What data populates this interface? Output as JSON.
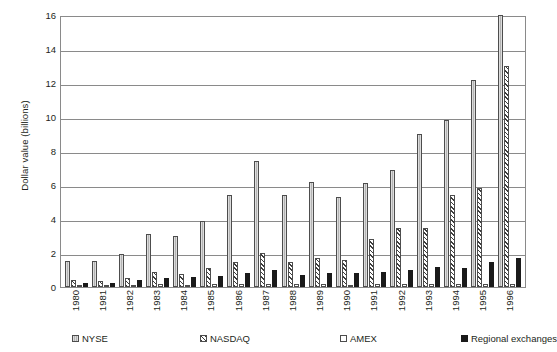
{
  "chart_data": {
    "type": "bar",
    "title": "",
    "xlabel": "",
    "ylabel": "Dollar value (billions)",
    "ylim": [
      0,
      16
    ],
    "yticks": [
      0,
      2,
      4,
      6,
      8,
      10,
      12,
      14,
      16
    ],
    "grid": true,
    "legend_position": "bottom",
    "categories": [
      "1980",
      "1981",
      "1982",
      "1983",
      "1984",
      "1985",
      "1986",
      "1987",
      "1988",
      "1989",
      "1990",
      "1991",
      "1992",
      "1993",
      "1994",
      "1995",
      "1996"
    ],
    "series": [
      {
        "name": "NYSE",
        "color": "#b3b3b3",
        "pattern": "vertical-lines",
        "values": [
          1.55,
          1.55,
          1.95,
          3.1,
          3.0,
          3.9,
          5.4,
          7.4,
          5.4,
          6.2,
          5.3,
          6.1,
          6.9,
          9.0,
          9.8,
          12.2,
          16.0
        ]
      },
      {
        "name": "NASDAQ",
        "color": "#ffffff",
        "pattern": "diagonal-hatch",
        "values": [
          0.4,
          0.35,
          0.55,
          0.9,
          0.75,
          1.1,
          1.5,
          2.0,
          1.5,
          1.7,
          1.6,
          2.8,
          3.5,
          3.5,
          5.4,
          5.8,
          13.0
        ]
      },
      {
        "name": "AMEX",
        "color": "#ffffff",
        "pattern": "solid-white",
        "values": [
          0.08,
          0.07,
          0.1,
          0.15,
          0.12,
          0.15,
          0.2,
          0.2,
          0.15,
          0.15,
          0.12,
          0.15,
          0.15,
          0.15,
          0.15,
          0.15,
          0.2
        ]
      },
      {
        "name": "Regional exchanges",
        "color": "#1a1a1a",
        "pattern": "solid-black",
        "values": [
          0.25,
          0.22,
          0.4,
          0.55,
          0.6,
          0.65,
          0.85,
          1.0,
          0.7,
          0.85,
          0.8,
          0.9,
          1.0,
          1.15,
          1.1,
          1.5,
          1.7
        ]
      }
    ]
  },
  "legend": {
    "items": [
      {
        "label": "NYSE"
      },
      {
        "label": "NASDAQ"
      },
      {
        "label": "AMEX"
      },
      {
        "label": "Regional exchanges"
      }
    ]
  }
}
